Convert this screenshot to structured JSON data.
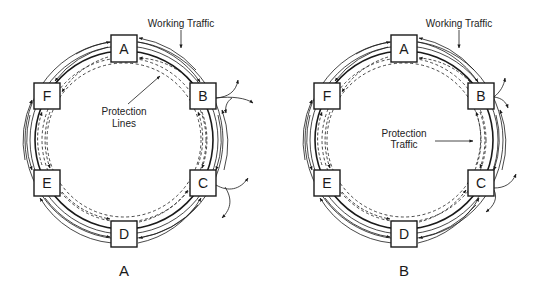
{
  "colors": {
    "stroke": "#1a1a1a",
    "background": "#ffffff"
  },
  "panels": [
    {
      "id": "A",
      "label": "A",
      "center": [
        124,
        140
      ],
      "nodes": [
        {
          "name": "A",
          "x": 124,
          "y": 48
        },
        {
          "name": "B",
          "x": 203,
          "y": 96
        },
        {
          "name": "C",
          "x": 203,
          "y": 183
        },
        {
          "name": "D",
          "x": 124,
          "y": 234
        },
        {
          "name": "E",
          "x": 47,
          "y": 183
        },
        {
          "name": "F",
          "x": 47,
          "y": 96
        }
      ],
      "annotations": {
        "working_traffic": "Working Traffic",
        "protection_line1": "Protection",
        "protection_line2": "Lines"
      }
    },
    {
      "id": "B",
      "label": "B",
      "center": [
        404,
        140
      ],
      "nodes": [
        {
          "name": "A",
          "x": 404,
          "y": 48
        },
        {
          "name": "B",
          "x": 481,
          "y": 96
        },
        {
          "name": "C",
          "x": 481,
          "y": 183
        },
        {
          "name": "D",
          "x": 404,
          "y": 234
        },
        {
          "name": "E",
          "x": 327,
          "y": 183
        },
        {
          "name": "F",
          "x": 327,
          "y": 96
        }
      ],
      "annotations": {
        "working_traffic": "Working Traffic",
        "protection_line1": "Protection",
        "protection_line2": "Traffic"
      }
    }
  ]
}
